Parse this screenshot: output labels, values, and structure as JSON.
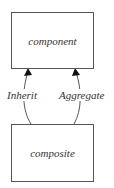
{
  "diagram": {
    "nodes": [
      {
        "id": "component",
        "label": "component"
      },
      {
        "id": "composite",
        "label": "composite"
      }
    ],
    "edges": [
      {
        "from": "composite",
        "to": "component",
        "label": "Inherit"
      },
      {
        "from": "composite",
        "to": "component",
        "label": "Aggregate"
      }
    ],
    "colors": {
      "stroke": "#555555",
      "text": "#333333",
      "background": "#ffffff"
    }
  }
}
